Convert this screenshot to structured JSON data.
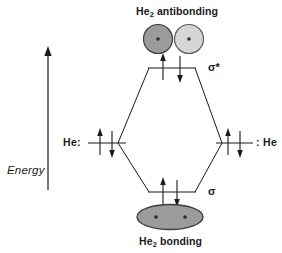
{
  "figure": {
    "title_top": "He2 antibonding",
    "title_bottom": "He2 bonding",
    "energy_axis_label": "Energy",
    "left_atom_label": "He:",
    "right_atom_label": ": He",
    "antibonding_orbital_label": "σ*",
    "bonding_orbital_label": "σ",
    "he_text": "He",
    "he_subscript": "2",
    "antibonding_word": " antibonding",
    "bonding_word": " bonding",
    "colors": {
      "stroke": "#1a1a1a",
      "background": "#ffffff",
      "lobe_dark": "#9b9b9b",
      "lobe_light": "#d6d6d6",
      "lobe_bonding": "#9b9b9b",
      "dot": "#2a2a2a"
    }
  },
  "levels": [
    {
      "name": "sigma-star",
      "label": "σ*",
      "kind": "antibonding",
      "electrons": 2,
      "spins": [
        "up",
        "down"
      ]
    },
    {
      "name": "he-left-1s",
      "label": "He:",
      "kind": "atomic",
      "electrons": 2,
      "spins": [
        "up",
        "down"
      ]
    },
    {
      "name": "he-right-1s",
      "label": ": He",
      "kind": "atomic",
      "electrons": 2,
      "spins": [
        "up",
        "down"
      ]
    },
    {
      "name": "sigma",
      "label": "σ",
      "kind": "bonding",
      "electrons": 2,
      "spins": [
        "up",
        "down"
      ]
    }
  ],
  "orbital_shapes": {
    "antibonding": {
      "description": "two separate circles with nodal gap",
      "lobes": 2,
      "dots": 2
    },
    "bonding": {
      "description": "single merged ellipse",
      "lobes": 1,
      "dots": 2
    }
  }
}
